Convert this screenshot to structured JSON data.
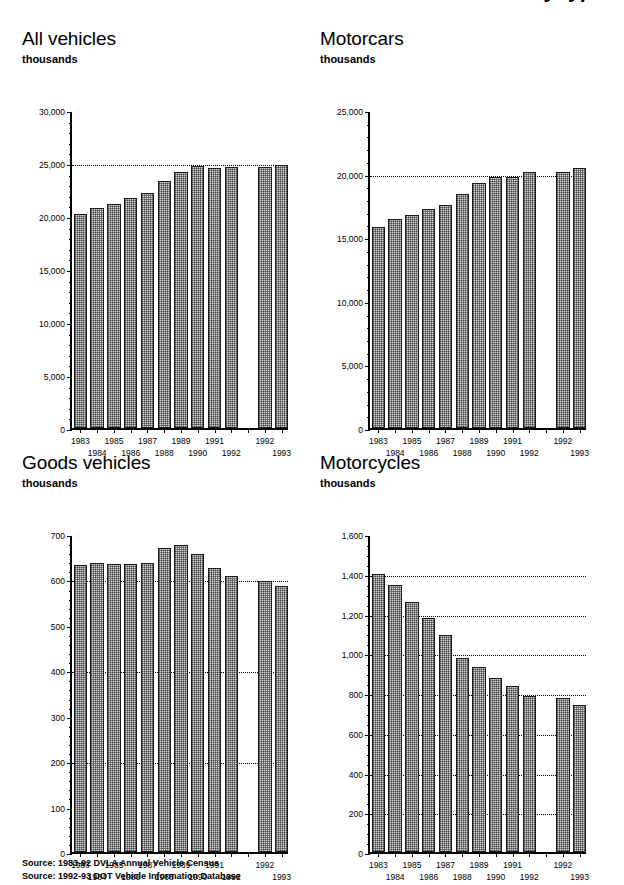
{
  "page": {
    "title": "Vehicles licensed by type",
    "unit_label": "thousands"
  },
  "sources": [
    "Source: 1983-92 DVLA Annual Vehicle Census",
    "Source: 1992-93 DOT Vehicle Information Database"
  ],
  "charts": [
    {
      "id": "all-vehicles",
      "title": "All vehicles",
      "unit": "thousands",
      "chart_data": {
        "type": "bar",
        "title": "All vehicles",
        "xlabel": "",
        "ylabel": "thousands",
        "ylim": [
          0,
          30000
        ],
        "yticks": [
          0,
          5000,
          10000,
          15000,
          20000,
          25000,
          30000
        ],
        "ytick_labels": [
          "0",
          "5,000",
          "10,000",
          "15,000",
          "20,000",
          "25,000",
          "30,000"
        ],
        "minor_tick_step": 1000,
        "gridlines": [
          25000
        ],
        "grid": "dotted-horizontal-at-25000",
        "legend": "none",
        "gap_after_index": 9,
        "categories": [
          "1983",
          "1984",
          "1985",
          "1986",
          "1987",
          "1988",
          "1989",
          "1990",
          "1991",
          "1992",
          "1992",
          "1993"
        ],
        "values": [
          20209,
          20765,
          21167,
          21699,
          22152,
          23302,
          24196,
          24673,
          24511,
          24577,
          24577,
          24826
        ],
        "series_note": "first 10 bars DVLA 1983-92; last 2 bars DOT 1992-93"
      }
    },
    {
      "id": "motorcars",
      "title": "Motorcars",
      "unit": "thousands",
      "chart_data": {
        "type": "bar",
        "title": "Motorcars",
        "xlabel": "",
        "ylabel": "thousands",
        "ylim": [
          0,
          25000
        ],
        "yticks": [
          0,
          5000,
          10000,
          15000,
          20000,
          25000
        ],
        "ytick_labels": [
          "0",
          "5,000",
          "10,000",
          "15,000",
          "20,000",
          "25,000"
        ],
        "minor_tick_step": 1000,
        "gridlines": [
          20000
        ],
        "grid": "dotted-horizontal-at-20000",
        "legend": "none",
        "gap_after_index": 9,
        "categories": [
          "1983",
          "1984",
          "1985",
          "1986",
          "1987",
          "1988",
          "1989",
          "1990",
          "1991",
          "1992",
          "1992",
          "1993"
        ],
        "values": [
          15793,
          16425,
          16721,
          17196,
          17529,
          18432,
          19248,
          19742,
          19737,
          20103,
          20103,
          20471
        ],
        "series_note": "first 10 bars DVLA 1983-92; last 2 bars DOT 1992-93"
      }
    },
    {
      "id": "goods-vehicles",
      "title": "Goods vehicles",
      "unit": "thousands",
      "chart_data": {
        "type": "bar",
        "title": "Goods vehicles",
        "xlabel": "",
        "ylabel": "thousands",
        "ylim": [
          0,
          700
        ],
        "yticks": [
          0,
          100,
          200,
          300,
          400,
          500,
          600,
          700
        ],
        "ytick_labels": [
          "0",
          "100",
          "200",
          "300",
          "400",
          "500",
          "600",
          "700"
        ],
        "minor_tick_step": 20,
        "gridlines": [
          200,
          400,
          600
        ],
        "grid": "dotted-horizontal",
        "legend": "none",
        "gap_after_index": 9,
        "categories": [
          "1983",
          "1984",
          "1985",
          "1986",
          "1987",
          "1988",
          "1989",
          "1990",
          "1991",
          "1992",
          "1992",
          "1993"
        ],
        "values": [
          632,
          637,
          633,
          633,
          637,
          670,
          675,
          655,
          625,
          607,
          597,
          586
        ],
        "series_note": "first 10 bars DVLA 1983-92; last 2 bars DOT 1992-93"
      }
    },
    {
      "id": "motorcycles",
      "title": "Motorcycles",
      "unit": "thousands",
      "chart_data": {
        "type": "bar",
        "title": "Motorcycles",
        "xlabel": "",
        "ylabel": "thousands",
        "ylim": [
          0,
          1600
        ],
        "yticks": [
          0,
          200,
          400,
          600,
          800,
          1000,
          1200,
          1400,
          1600
        ],
        "ytick_labels": [
          "0",
          "200",
          "400",
          "600",
          "800",
          "1,000",
          "1,200",
          "1,400",
          "1,600"
        ],
        "minor_tick_step": 50,
        "gridlines": [
          200,
          400,
          600,
          800,
          1000,
          1200,
          1400
        ],
        "grid": "dotted-horizontal",
        "legend": "none",
        "gap_after_index": 9,
        "categories": [
          "1983",
          "1984",
          "1985",
          "1986",
          "1987",
          "1988",
          "1989",
          "1990",
          "1991",
          "1992",
          "1992",
          "1993"
        ],
        "values": [
          1400,
          1345,
          1258,
          1177,
          1090,
          975,
          930,
          875,
          833,
          785,
          775,
          740
        ],
        "series_note": "first 10 bars DVLA 1983-92; last 2 bars DOT 1992-93"
      }
    }
  ]
}
